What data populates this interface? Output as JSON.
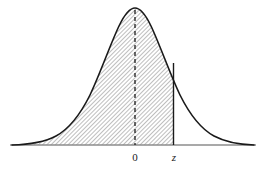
{
  "figure": {
    "background_color": "#ffffff",
    "width": 275,
    "height": 172
  },
  "axis": {
    "name": "horizontal-axis",
    "color": "#8c8c8c",
    "y": 145,
    "x_start": 10,
    "x_end": 256,
    "stroke_width": 1.3
  },
  "curve": {
    "name": "normal-curve",
    "color": "#1a1a1a",
    "stroke_width": 1.6,
    "peak_x": 135,
    "peak_y": 8,
    "left_tail_x": 12,
    "right_tail_x": 254,
    "baseline_y": 145
  },
  "shading": {
    "name": "shaded-area",
    "pattern": "diagonal-hatch",
    "hatch_color": "#6e6e6e",
    "hatch_spacing": 3,
    "hatch_angle_deg": 45,
    "fill_color": "#ffffff",
    "from_x": 12,
    "to_x": 173.5
  },
  "center_line": {
    "name": "mean-dashed-line",
    "x": 135,
    "y_top": 10,
    "y_bottom": 145,
    "color": "#1a1a1a",
    "dash_pattern": "4 3",
    "stroke_width": 1.3
  },
  "z_line": {
    "name": "z-boundary-line",
    "x": 173.5,
    "y_top": 63,
    "y_bottom": 145,
    "color": "#1a1a1a",
    "stroke_width": 1.4
  },
  "labels": [
    {
      "id": "label-zero",
      "text": "0",
      "x": 135,
      "y": 161,
      "italic": false
    },
    {
      "id": "label-z",
      "text": "z",
      "x": 174,
      "y": 161,
      "italic": true
    }
  ],
  "chart_data": {
    "type": "area",
    "xlabel": "",
    "ylabel": "",
    "distribution": "standard normal",
    "mean": 0,
    "std_dev": 1,
    "grid": false,
    "legend": false,
    "tick_labels": [
      "0",
      "z"
    ],
    "tick_values": [
      0,
      1.0
    ],
    "tick_x_pixels": [
      135,
      173.5
    ],
    "shaded_region": {
      "label": "area left of z",
      "from": "-infinity",
      "to": "z"
    },
    "annotations": [
      {
        "text": "0",
        "type": "x-tick",
        "value": 0
      },
      {
        "text": "z",
        "type": "x-tick",
        "value": "z"
      }
    ],
    "series": [
      {
        "name": "normal pdf",
        "x": [
          -3.6,
          -3.2,
          -2.8,
          -2.4,
          -2.0,
          -1.6,
          -1.2,
          -0.8,
          -0.4,
          0.0,
          0.4,
          0.8,
          1.2,
          1.6,
          2.0,
          2.4,
          2.8,
          3.2,
          3.6
        ],
        "values": [
          0.0006,
          0.0024,
          0.0079,
          0.0224,
          0.054,
          0.1109,
          0.1942,
          0.2897,
          0.3683,
          0.3989,
          0.3683,
          0.2897,
          0.1942,
          0.1109,
          0.054,
          0.0224,
          0.0079,
          0.0024,
          0.0006
        ]
      }
    ],
    "xlim": [
      -3.6,
      3.6
    ],
    "ylim": [
      0,
      0.42
    ]
  }
}
